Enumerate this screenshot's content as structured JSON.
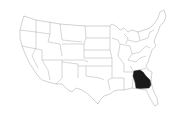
{
  "map": {
    "region": "United States",
    "style": "outline map of contiguous US states",
    "highlighted_state": "Georgia",
    "highlight_color": "#1a1a1a",
    "state_fill": "#ffffff",
    "border_color": "#9a9a9a",
    "background": "#ffffff"
  }
}
